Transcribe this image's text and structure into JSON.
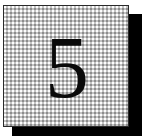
{
  "badge": {
    "value": "5",
    "colors": {
      "shadow": "#000000",
      "card_fill": "#c4c4c4",
      "border": "#2a2a2a",
      "digit": "#0a0a0a"
    }
  }
}
